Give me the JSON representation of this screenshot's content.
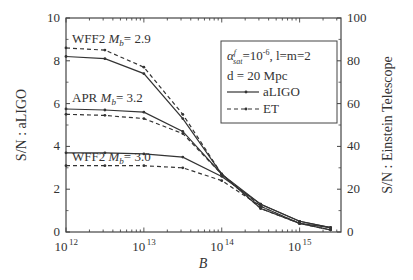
{
  "chart_data": {
    "type": "line",
    "title": "",
    "xlabel": "B",
    "ylabel": "S/N : aLIGO",
    "ylabel_right": "S/N : Einstein Telescope",
    "xscale": "log",
    "xlim": [
      1000000000000.0,
      3400000000000000.0
    ],
    "ylim": [
      0,
      10
    ],
    "ylim_right": [
      0,
      100
    ],
    "x_ticks": [
      {
        "value": 1000000000000.0,
        "base": "10",
        "exp": "12"
      },
      {
        "value": 10000000000000.0,
        "base": "10",
        "exp": "13"
      },
      {
        "value": 100000000000000.0,
        "base": "10",
        "exp": "14"
      },
      {
        "value": 1000000000000000.0,
        "base": "10",
        "exp": "15"
      }
    ],
    "y_ticks": [
      "0",
      "2",
      "4",
      "6",
      "8",
      "10"
    ],
    "y_ticks_right": [
      "0",
      "20",
      "40",
      "60",
      "80",
      "100"
    ],
    "grid": false,
    "x": [
      1000000000000.0,
      3160000000000.0,
      10000000000000.0,
      31600000000000.0,
      100000000000000.0,
      316000000000000.0,
      1000000000000000.0,
      2500000000000000.0
    ],
    "series": [
      {
        "name": "WFF2 Mb=2.9 aLIGO",
        "detector": "aLIGO",
        "axis": "left",
        "style": "solid",
        "values": [
          8.2,
          8.1,
          7.4,
          5.3,
          2.7,
          1.3,
          0.5,
          0.2
        ]
      },
      {
        "name": "WFF2 Mb=2.9 ET",
        "detector": "ET",
        "axis": "right",
        "style": "dashed",
        "values": [
          86,
          85,
          77,
          55,
          27,
          12,
          4,
          1
        ]
      },
      {
        "name": "APR Mb=3.2 aLIGO",
        "detector": "aLIGO",
        "axis": "left",
        "style": "solid",
        "values": [
          5.75,
          5.7,
          5.6,
          4.7,
          2.7,
          1.1,
          0.4,
          0.2
        ]
      },
      {
        "name": "APR Mb=3.2 ET",
        "detector": "ET",
        "axis": "right",
        "style": "dashed",
        "values": [
          55,
          54.5,
          53,
          46,
          27,
          11,
          4,
          1
        ]
      },
      {
        "name": "WFF2 Mb=3.0 aLIGO",
        "detector": "aLIGO",
        "axis": "left",
        "style": "solid",
        "values": [
          3.7,
          3.7,
          3.65,
          3.5,
          2.6,
          1.3,
          0.5,
          0.2
        ]
      },
      {
        "name": "WFF2 Mb=3.0 ET",
        "detector": "ET",
        "axis": "right",
        "style": "dashed",
        "values": [
          31,
          31,
          31,
          30,
          24,
          12,
          4,
          1
        ]
      }
    ],
    "annotations": [
      {
        "eos": "WFF2",
        "mass_label": "M",
        "mass_sub": "b",
        "mass_value": "= 2.9"
      },
      {
        "eos": "APR",
        "mass_label": "M",
        "mass_sub": "b",
        "mass_value": "= 3.2"
      },
      {
        "eos": "WFF2",
        "mass_label": "M",
        "mass_sub": "b",
        "mass_value": "= 3.0"
      }
    ],
    "legend": {
      "position": "upper right",
      "line1": {
        "alpha": "α",
        "sup": "f",
        "sub": "sat",
        "value": "=10",
        "exp": "-6",
        "rest": ", l=m=2"
      },
      "line2": "d = 20 Mpc",
      "entries": [
        {
          "label": "aLIGO",
          "style": "solid"
        },
        {
          "label": "ET",
          "style": "dashed"
        }
      ]
    },
    "colors": {
      "line": "#333333",
      "axis": "#444444"
    }
  }
}
